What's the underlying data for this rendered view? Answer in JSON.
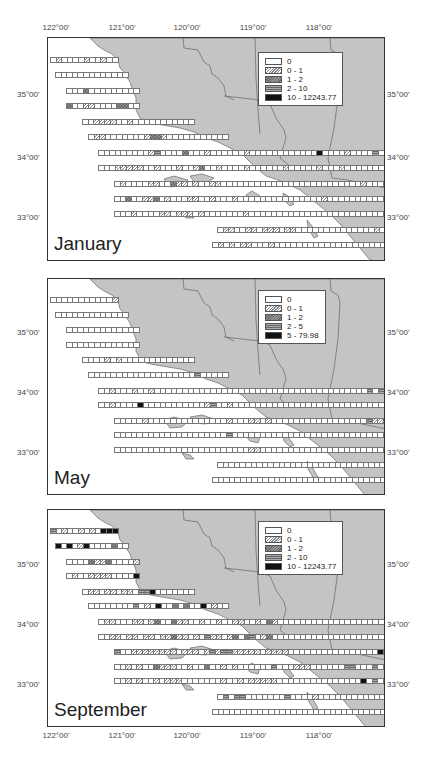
{
  "figure": {
    "top_lon_labels": [
      "122°00'",
      "121°00'",
      "120°00'",
      "119°00'",
      "118°00'"
    ],
    "bottom_lon_labels": [
      "122°00'",
      "121°00'",
      "120°00'",
      "119°00'",
      "118°00'"
    ],
    "lat_labels": [
      "35°00'",
      "34°00'",
      "33°00'"
    ],
    "colors": {
      "land": "#c4c4c4",
      "ocean": "#ffffff",
      "border": "#333333",
      "cell_outline": "#777777"
    }
  },
  "panels": [
    {
      "month": "January",
      "legend": {
        "title": "",
        "entries": [
          {
            "label": "0",
            "class": "c0"
          },
          {
            "label": "0 - 1",
            "class": "c1"
          },
          {
            "label": "1 - 2",
            "class": "c2"
          },
          {
            "label": "2 - 10",
            "class": "c3"
          },
          {
            "label": "10 - 12243.77",
            "class": "c4"
          }
        ]
      }
    },
    {
      "month": "May",
      "legend": {
        "title": "",
        "entries": [
          {
            "label": "0",
            "class": "c0"
          },
          {
            "label": "0 - 1",
            "class": "c1"
          },
          {
            "label": "1 - 2",
            "class": "c2"
          },
          {
            "label": "2 - 5",
            "class": "c3"
          },
          {
            "label": "5 - 79.98",
            "class": "c4"
          }
        ]
      }
    },
    {
      "month": "September",
      "legend": {
        "title": "",
        "entries": [
          {
            "label": "0",
            "class": "c0"
          },
          {
            "label": "0 - 1",
            "class": "c1"
          },
          {
            "label": "1 - 2",
            "class": "c2"
          },
          {
            "label": "2 - 10",
            "class": "c3"
          },
          {
            "label": "10 - 12243.77",
            "class": "c4"
          }
        ]
      }
    }
  ],
  "transects": {
    "description": "Survey transect rows; each row: y offset (px from panel top), start x (px), cell count. Values per month are category codes 0-4 per cell.",
    "rows": [
      {
        "y": 19,
        "x": 2,
        "n": 12
      },
      {
        "y": 34,
        "x": 7,
        "n": 13
      },
      {
        "y": 50,
        "x": 18,
        "n": 13
      },
      {
        "y": 65,
        "x": 18,
        "n": 13
      },
      {
        "y": 81,
        "x": 34,
        "n": 20
      },
      {
        "y": 96,
        "x": 40,
        "n": 25
      },
      {
        "y": 112,
        "x": 50,
        "n": 60
      },
      {
        "y": 127,
        "x": 50,
        "n": 60
      },
      {
        "y": 143,
        "x": 66,
        "n": 55
      },
      {
        "y": 158,
        "x": 66,
        "n": 58
      },
      {
        "y": 173,
        "x": 66,
        "n": 59
      },
      {
        "y": 189,
        "x": 169,
        "n": 41
      },
      {
        "y": 204,
        "x": 164,
        "n": 41
      }
    ],
    "january": [
      [
        0,
        1,
        0,
        0,
        0,
        0,
        1,
        0,
        0,
        1,
        0,
        0
      ],
      [
        0,
        0,
        0,
        0,
        0,
        0,
        0,
        0,
        0,
        0,
        0,
        0,
        0
      ],
      [
        0,
        0,
        0,
        2,
        0,
        0,
        0,
        0,
        0,
        0,
        0,
        0,
        0
      ],
      [
        2,
        0,
        0,
        1,
        1,
        0,
        0,
        0,
        0,
        2,
        2,
        0,
        0
      ],
      [
        0,
        0,
        1,
        1,
        1,
        1,
        0,
        0,
        1,
        0,
        0,
        0,
        0,
        0,
        0,
        0,
        0,
        0,
        0,
        0
      ],
      [
        0,
        1,
        1,
        0,
        0,
        0,
        0,
        0,
        0,
        0,
        1,
        2,
        2,
        1,
        0,
        0,
        0,
        0,
        0,
        0,
        0,
        0,
        0,
        0,
        0
      ],
      [
        0,
        0,
        0,
        0,
        0,
        0,
        0,
        0,
        0,
        1,
        3,
        0,
        0,
        0,
        0,
        2,
        0,
        0,
        0,
        1,
        0,
        0,
        0,
        0,
        0,
        0,
        1,
        0,
        0,
        0,
        0,
        0,
        0,
        0,
        0,
        0,
        0,
        0,
        0,
        4,
        0,
        0,
        0,
        0,
        1,
        0,
        0,
        0,
        0,
        3,
        0,
        0,
        0,
        0,
        0,
        0,
        0,
        0,
        0,
        0
      ],
      [
        0,
        0,
        0,
        1,
        1,
        1,
        1,
        1,
        0,
        0,
        1,
        0,
        0,
        0,
        1,
        0,
        0,
        1,
        2,
        0,
        0,
        1,
        0,
        0,
        0,
        0,
        1,
        0,
        0,
        0,
        0,
        0,
        0,
        1,
        0,
        0,
        0,
        0,
        0,
        1,
        0,
        0,
        0,
        1,
        0,
        0,
        0,
        0,
        0,
        0,
        0,
        0,
        0,
        0,
        0,
        0,
        0,
        0,
        0,
        0
      ],
      [
        0,
        1,
        0,
        0,
        0,
        0,
        1,
        1,
        0,
        0,
        2,
        1,
        1,
        0,
        1,
        0,
        0,
        1,
        1,
        0,
        0,
        0,
        0,
        0,
        0,
        0,
        0,
        0,
        0,
        0,
        0,
        0,
        0,
        0,
        0,
        0,
        0,
        0,
        0,
        0,
        0,
        0,
        0,
        0,
        1,
        0,
        0,
        0,
        0,
        0,
        0,
        1,
        0,
        1,
        0
      ],
      [
        0,
        0,
        2,
        0,
        0,
        1,
        1,
        2,
        0,
        1,
        0,
        0,
        0,
        1,
        1,
        0,
        0,
        1,
        0,
        0,
        0,
        1,
        0,
        0,
        0,
        0,
        0,
        0,
        0,
        0,
        0,
        0,
        0,
        0,
        0,
        0,
        0,
        1,
        0,
        0,
        0,
        0,
        0,
        0,
        0,
        0,
        0,
        0,
        0,
        0,
        0,
        0,
        0,
        0,
        0,
        0,
        0,
        0
      ],
      [
        0,
        0,
        0,
        1,
        0,
        0,
        0,
        0,
        1,
        1,
        0,
        1,
        1,
        1,
        0,
        1,
        0,
        0,
        0,
        0,
        0,
        0,
        0,
        1,
        0,
        0,
        0,
        0,
        0,
        0,
        0,
        0,
        0,
        0,
        0,
        0,
        0,
        0,
        0,
        0,
        0,
        0,
        0,
        0,
        0,
        0,
        0,
        0,
        0,
        0,
        0,
        0,
        0,
        0,
        1,
        0,
        0,
        0,
        0
      ],
      [
        0,
        1,
        1,
        0,
        0,
        1,
        1,
        0,
        1,
        1,
        1,
        0,
        1,
        1,
        0,
        0,
        0,
        0,
        0,
        0,
        0,
        0,
        0,
        0,
        0,
        0,
        0,
        0,
        1,
        0,
        0,
        0,
        0,
        1,
        1,
        0,
        0,
        0,
        0,
        0,
        4
      ],
      [
        0,
        1,
        0,
        1,
        0,
        1,
        1,
        0,
        0,
        0,
        1,
        0,
        0,
        0,
        0,
        0,
        0,
        0,
        0,
        0,
        0,
        0,
        0,
        0,
        0,
        0,
        0,
        0,
        0,
        0,
        0,
        0,
        0,
        0,
        0,
        0,
        0,
        0,
        0,
        0,
        0
      ]
    ],
    "may": [
      [
        0,
        0,
        0,
        0,
        0,
        0,
        0,
        0,
        0,
        0,
        0,
        1
      ],
      [
        0,
        0,
        0,
        0,
        0,
        0,
        0,
        0,
        0,
        0,
        0,
        0,
        0
      ],
      [
        0,
        0,
        0,
        0,
        0,
        0,
        0,
        0,
        0,
        0,
        0,
        0,
        0
      ],
      [
        0,
        0,
        0,
        0,
        0,
        0,
        0,
        0,
        0,
        0,
        0,
        0,
        0
      ],
      [
        0,
        0,
        0,
        0,
        1,
        0,
        1,
        0,
        0,
        0,
        0,
        0,
        0,
        0,
        0,
        0,
        0,
        0,
        0,
        0
      ],
      [
        0,
        0,
        0,
        0,
        0,
        0,
        0,
        0,
        0,
        0,
        0,
        0,
        0,
        0,
        0,
        0,
        0,
        0,
        0,
        3,
        0,
        0,
        0,
        0,
        0
      ],
      [
        0,
        0,
        1,
        0,
        0,
        0,
        1,
        0,
        0,
        1,
        0,
        0,
        0,
        0,
        0,
        0,
        0,
        0,
        0,
        0,
        0,
        0,
        0,
        0,
        0,
        0,
        0,
        0,
        0,
        0,
        0,
        0,
        0,
        0,
        0,
        0,
        0,
        0,
        0,
        0,
        0,
        0,
        0,
        0,
        0,
        0,
        0,
        0,
        3,
        0,
        3,
        0,
        0,
        0,
        0,
        0,
        0,
        0,
        0,
        0
      ],
      [
        0,
        0,
        1,
        0,
        0,
        0,
        0,
        4,
        0,
        0,
        0,
        0,
        0,
        0,
        0,
        0,
        0,
        0,
        0,
        1,
        3,
        0,
        0,
        1,
        0,
        0,
        0,
        0,
        0,
        0,
        0,
        0,
        0,
        0,
        0,
        0,
        0,
        0,
        0,
        0,
        0,
        0,
        0,
        0,
        0,
        0,
        0,
        0,
        0,
        0,
        0,
        0,
        4,
        0,
        4,
        4,
        3,
        3,
        0,
        0
      ],
      [
        0,
        0,
        0,
        0,
        0,
        1,
        0,
        0,
        0,
        0,
        0,
        0,
        0,
        0,
        0,
        0,
        0,
        0,
        0,
        0,
        1,
        0,
        0,
        0,
        1,
        1,
        0,
        1,
        0,
        0,
        0,
        0,
        0,
        0,
        0,
        0,
        0,
        0,
        0,
        0,
        0,
        0,
        0,
        0,
        0,
        3,
        1,
        1,
        0,
        1,
        1,
        4,
        4,
        3,
        4
      ],
      [
        0,
        0,
        0,
        0,
        0,
        0,
        0,
        0,
        0,
        0,
        0,
        0,
        0,
        0,
        0,
        0,
        0,
        0,
        0,
        0,
        3,
        0,
        0,
        0,
        0,
        0,
        0,
        0,
        0,
        0,
        0,
        0,
        0,
        0,
        0,
        0,
        0,
        0,
        0,
        0,
        0,
        0,
        0,
        0,
        0,
        0,
        0,
        0,
        0,
        0,
        0,
        0,
        0,
        0,
        1,
        1,
        4,
        3
      ],
      [
        0,
        0,
        0,
        0,
        0,
        0,
        0,
        0,
        0,
        0,
        0,
        0,
        0,
        0,
        0,
        0,
        0,
        0,
        0,
        0,
        0,
        0,
        0,
        0,
        1,
        1,
        0,
        0,
        0,
        0,
        0,
        0,
        0,
        0,
        0,
        0,
        0,
        0,
        0,
        0,
        0,
        0,
        0,
        0,
        0,
        0,
        0,
        0,
        0,
        0,
        0,
        0,
        0,
        0,
        1,
        0,
        0,
        1,
        3
      ],
      [
        0,
        0,
        0,
        0,
        0,
        0,
        0,
        0,
        0,
        0,
        0,
        0,
        0,
        0,
        0,
        0,
        0,
        0,
        0,
        0,
        0,
        0,
        0,
        0,
        0,
        0,
        0,
        0,
        0,
        0,
        0,
        0,
        0,
        0,
        0,
        0,
        0,
        0,
        1,
        0,
        3
      ],
      [
        0,
        0,
        0,
        0,
        0,
        0,
        0,
        0,
        0,
        0,
        0,
        0,
        0,
        0,
        0,
        0,
        0,
        0,
        0,
        0,
        0,
        0,
        0,
        0,
        0,
        0,
        0,
        0,
        0,
        0,
        0,
        0,
        0,
        0,
        0,
        0,
        0,
        0,
        0,
        3,
        4
      ]
    ],
    "september": [
      [
        3,
        0,
        1,
        0,
        0,
        1,
        0,
        1,
        0,
        4,
        4,
        4
      ],
      [
        4,
        0,
        4,
        0,
        1,
        4,
        0,
        0,
        0,
        0,
        2,
        0,
        0
      ],
      [
        0,
        0,
        0,
        0,
        2,
        1,
        1,
        2,
        0,
        0,
        0,
        0,
        1,
        4
      ],
      [
        0,
        1,
        0,
        0,
        1,
        1,
        1,
        1,
        0,
        0,
        0,
        0,
        4
      ],
      [
        0,
        1,
        1,
        0,
        1,
        1,
        0,
        1,
        1,
        0,
        3,
        3,
        4,
        0,
        0,
        0,
        0,
        0,
        0,
        0
      ],
      [
        0,
        0,
        0,
        0,
        0,
        0,
        0,
        0,
        3,
        0,
        1,
        0,
        4,
        0,
        0,
        2,
        0,
        2,
        0,
        0,
        4,
        0,
        1,
        0,
        0
      ],
      [
        0,
        1,
        1,
        0,
        0,
        0,
        1,
        1,
        0,
        1,
        2,
        0,
        0,
        2,
        1,
        1,
        0,
        0,
        1,
        0,
        0,
        1,
        0,
        0,
        1,
        1,
        0,
        0,
        1,
        0,
        2,
        1,
        0,
        0,
        0,
        0,
        0,
        0,
        0,
        0,
        0,
        0,
        0,
        0,
        0,
        0,
        0,
        0,
        0,
        0,
        0,
        0,
        0,
        0,
        0,
        0,
        0,
        0,
        0,
        0
      ],
      [
        0,
        0,
        1,
        1,
        0,
        1,
        1,
        0,
        1,
        1,
        0,
        1,
        1,
        2,
        1,
        1,
        0,
        1,
        0,
        3,
        1,
        1,
        0,
        1,
        2,
        0,
        2,
        3,
        0,
        1,
        2,
        0,
        0,
        0,
        0,
        0,
        0,
        0,
        0,
        0,
        0,
        0,
        0,
        0,
        0,
        0,
        0,
        0,
        0,
        0,
        0,
        0,
        0,
        0,
        0,
        0,
        0,
        0,
        0,
        0
      ],
      [
        3,
        0,
        0,
        1,
        1,
        1,
        1,
        1,
        1,
        1,
        1,
        0,
        1,
        1,
        1,
        0,
        1,
        3,
        1,
        3,
        3,
        1,
        1,
        1,
        1,
        1,
        0,
        1,
        1,
        1,
        1,
        0,
        0,
        0,
        0,
        0,
        0,
        0,
        0,
        0,
        0,
        0,
        0,
        0,
        0,
        0,
        0,
        4,
        0,
        0,
        0,
        0,
        0,
        0,
        0
      ],
      [
        0,
        0,
        1,
        0,
        1,
        0,
        0,
        2,
        1,
        1,
        1,
        0,
        0,
        1,
        0,
        0,
        2,
        0,
        0,
        1,
        0,
        1,
        0,
        0,
        0,
        0,
        0,
        0,
        3,
        0,
        0,
        0,
        1,
        1,
        1,
        0,
        0,
        0,
        0,
        0,
        0,
        3,
        3,
        0,
        0,
        0,
        3,
        0,
        0,
        0,
        0,
        0,
        0,
        4,
        0,
        0,
        0,
        0
      ],
      [
        0,
        0,
        1,
        0,
        1,
        0,
        0,
        1,
        0,
        1,
        1,
        1,
        0,
        0,
        0,
        0,
        0,
        0,
        0,
        1,
        0,
        0,
        1,
        0,
        1,
        1,
        1,
        1,
        1,
        0,
        0,
        0,
        0,
        0,
        0,
        0,
        0,
        0,
        0,
        0,
        0,
        0,
        0,
        0,
        4,
        0,
        3,
        0,
        0,
        0,
        1,
        0,
        0,
        0,
        0,
        0,
        0,
        3,
        0
      ],
      [
        0,
        3,
        0,
        3,
        3,
        0,
        0,
        0,
        0,
        0,
        0,
        0,
        3,
        0,
        0,
        0,
        0,
        1,
        0,
        0,
        0,
        0,
        0,
        0,
        0,
        0,
        0,
        0,
        0,
        0,
        0,
        0,
        0,
        0,
        0,
        0,
        0,
        3,
        0,
        0,
        0
      ],
      [
        0,
        0,
        0,
        0,
        0,
        0,
        0,
        0,
        0,
        0,
        0,
        0,
        0,
        0,
        0,
        0,
        0,
        0,
        0,
        0,
        0,
        0,
        0,
        0,
        0,
        0,
        0,
        0,
        0,
        0,
        0,
        0,
        0,
        0,
        0,
        0,
        0,
        0,
        0,
        0,
        0
      ]
    ]
  }
}
